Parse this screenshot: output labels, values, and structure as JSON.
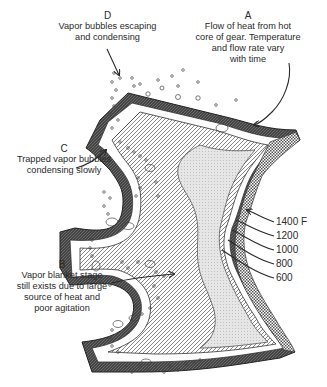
{
  "annotations": {
    "A": {
      "letter": "A",
      "lines": [
        "Flow of heat from hot",
        "core of gear.  Temperature",
        "and flow rate vary",
        "with time"
      ]
    },
    "B": {
      "letter": "B",
      "lines": [
        "Vapor blanket stage",
        "still exists due to large",
        "source of heat and",
        "poor agitation"
      ]
    },
    "C": {
      "letter": "C",
      "lines": [
        "Trapped vapor bubbles",
        "condensing slowly"
      ]
    },
    "D": {
      "letter": "D",
      "lines": [
        "Vapor bubbles escaping",
        "and condensing"
      ]
    }
  },
  "isotherms": {
    "unit": "F",
    "labels": [
      "1400 F",
      "1200",
      "1000",
      "800",
      "600"
    ]
  },
  "colors": {
    "ink": "#2a2a2a",
    "background": "#ffffff"
  }
}
